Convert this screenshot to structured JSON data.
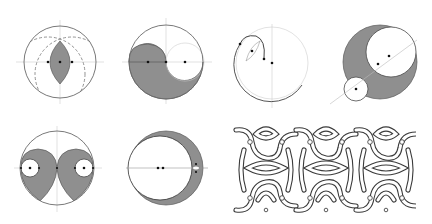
{
  "figure": {
    "type": "geometric-construction-plate",
    "panels": [
      {
        "id": "vesica",
        "description": "circle with two overlapping dashed circles, shaded lens (vesica piscis)",
        "center": [
          60,
          62
        ],
        "radius": 36
      },
      {
        "id": "yin-yang-half",
        "description": "circle with shaded S-curve region and white inner circle",
        "center": [
          166,
          62
        ],
        "radius": 37
      },
      {
        "id": "spiral",
        "description": "circle with spiral arc and small lens construction",
        "center": [
          272,
          63
        ],
        "radius": 36
      },
      {
        "id": "nested-circles",
        "description": "shaded circle containing two white tangent circles along diagonal axis",
        "center": [
          380,
          62
        ],
        "radius": 37
      },
      {
        "id": "twin-teardrops",
        "description": "circle with two shaded teardrops each containing a white circle",
        "center": [
          57,
          168
        ],
        "radius": 37
      },
      {
        "id": "crescent",
        "description": "circle with shaded crescent on the right side",
        "center": [
          166,
          168
        ],
        "radius": 37
      },
      {
        "id": "knotwork-border",
        "description": "interlaced ornamental knot pattern panel",
        "bbox": [
          232,
          126,
          414,
          213
        ]
      }
    ],
    "colors": {
      "shade": "#8f8f8f",
      "outline": "#6a6a6a",
      "guide": "#cfcfcf",
      "background": "#ffffff"
    }
  }
}
